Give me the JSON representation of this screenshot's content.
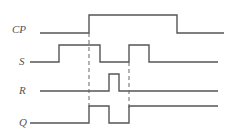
{
  "diagram": {
    "type": "timing-diagram",
    "signals": [
      {
        "name": "CP",
        "label": "CP",
        "label_pos": {
          "x": 12,
          "y": 24
        },
        "points": "40,33 89,33 89,15 177,15 177,33 224,33"
      },
      {
        "name": "S",
        "label": "S",
        "label_pos": {
          "x": 19,
          "y": 56
        },
        "points": "30,62 59,62 59,45 100,45 100,62 129,62 129,45 149,45 149,62 218,62"
      },
      {
        "name": "R",
        "label": "R",
        "label_pos": {
          "x": 19,
          "y": 85
        },
        "points": "40,91 109,91 109,74 119,74 119,91 218,91"
      },
      {
        "name": "Q",
        "label": "Q",
        "label_pos": {
          "x": 19,
          "y": 117
        },
        "points": "30,123 89,123 89,106 109,106 109,123 129,123 129,106 218,106"
      }
    ],
    "dashed_markers": [
      {
        "name": "cp-rising-edge-marker",
        "x": 89,
        "y1": 33,
        "y2": 110
      },
      {
        "name": "s-second-rise-marker",
        "x": 129,
        "y1": 62,
        "y2": 110
      }
    ],
    "colors": {
      "line": "#555555",
      "dash": "#666666",
      "background": "#ffffff"
    }
  }
}
